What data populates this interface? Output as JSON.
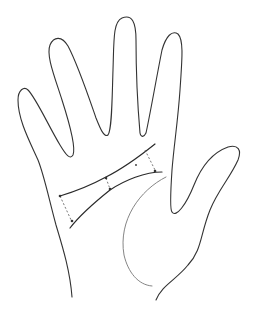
{
  "figure": {
    "description": "Line drawing of a left palm with two palm lines bounded by dashed measurement segments",
    "colors": {
      "background": "#ffffff",
      "outline": "#333333",
      "palm_line": "#2a2a2a",
      "life_line": "#777777",
      "dashed": "#555555"
    },
    "elements": {
      "hand_outline": "hand-outline",
      "upper_palm_line": "heart-line",
      "lower_palm_line": "head-line",
      "life_line": "life-line",
      "measure_segments": 3,
      "center_dot": "marker-dot"
    }
  }
}
